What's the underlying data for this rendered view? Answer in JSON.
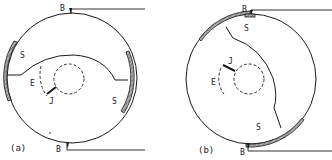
{
  "colors": {
    "ink": "#1a1a1a",
    "hatch": "#9a9a9a",
    "background": "#ffffff"
  },
  "panels": [
    {
      "caption": "(a)",
      "labels": {
        "top_b": "B",
        "bottom_b": "B",
        "s_left": "S",
        "s_right": "S",
        "e": "E",
        "j": "J"
      }
    },
    {
      "caption": "(b)",
      "labels": {
        "top_b": "B",
        "bottom_b": "B",
        "s_top": "S",
        "s_bottom": "S",
        "e": "E",
        "j": "J"
      }
    }
  ]
}
